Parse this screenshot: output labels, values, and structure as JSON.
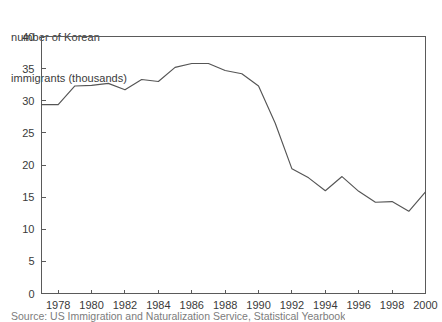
{
  "axis_title": {
    "line1": "number of Korean",
    "line2": "immigrants (thousands)"
  },
  "source_caption": "Source: US Immigration and Naturalization Service, Statistical Yearbook",
  "colors": {
    "line": "#555555",
    "axis": "#5a5a5a",
    "text": "#3a3a3a",
    "background": "#ffffff"
  },
  "chart_data": {
    "type": "line",
    "title": "number of Korean immigrants (thousands)",
    "xlabel": "",
    "ylabel": "number of Korean immigrants (thousands)",
    "xlim": [
      1977,
      2000
    ],
    "ylim": [
      0,
      40
    ],
    "grid": false,
    "legend": "none",
    "y_ticks": [
      0,
      5,
      10,
      15,
      20,
      25,
      30,
      35,
      40
    ],
    "y_tick_labels": [
      "0",
      "5",
      "10",
      "15",
      "20",
      "25",
      "30",
      "35",
      "40"
    ],
    "x_ticks": [
      1978,
      1980,
      1982,
      1984,
      1986,
      1988,
      1990,
      1992,
      1994,
      1996,
      1998,
      2000
    ],
    "x_tick_labels": [
      "1978",
      "1980",
      "1982",
      "1984",
      "1986",
      "1988",
      "1990",
      "1992",
      "1994",
      "1996",
      "1998",
      "2000"
    ],
    "x": [
      1977,
      1978,
      1979,
      1980,
      1981,
      1982,
      1983,
      1984,
      1985,
      1986,
      1987,
      1988,
      1989,
      1990,
      1991,
      1992,
      1993,
      1994,
      1995,
      1996,
      1997,
      1998,
      1999,
      2000
    ],
    "series": [
      {
        "name": "Korean immigrants",
        "values": [
          29.4,
          29.4,
          32.3,
          32.4,
          32.7,
          31.7,
          33.3,
          33.0,
          35.2,
          35.8,
          35.8,
          34.7,
          34.2,
          32.3,
          26.5,
          19.4,
          18.0,
          16.0,
          18.2,
          15.9,
          14.2,
          14.3,
          12.8,
          15.8
        ]
      }
    ]
  }
}
